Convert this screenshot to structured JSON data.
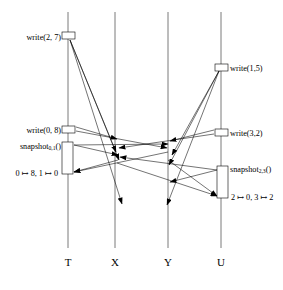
{
  "diagram": {
    "title": "",
    "type": "message-sequence-chart",
    "width": 283,
    "height": 290,
    "background": "#ffffff",
    "line_color": "#7a7a7a",
    "ink_color": "#000000",
    "processes": [
      {
        "id": "T",
        "label": "T",
        "x": 68,
        "top": 12,
        "bottom": 248,
        "axis_label_y": 266
      },
      {
        "id": "X",
        "label": "X",
        "x": 115,
        "top": 12,
        "bottom": 248,
        "axis_label_y": 266
      },
      {
        "id": "Y",
        "label": "Y",
        "x": 168,
        "top": 12,
        "bottom": 248,
        "axis_label_y": 266
      },
      {
        "id": "U",
        "label": "U",
        "x": 221,
        "top": 12,
        "bottom": 248,
        "axis_label_y": 266
      }
    ],
    "events": [
      {
        "id": "write-2-7",
        "label": "write(2, 7)",
        "process": "T",
        "label_side": "left",
        "label_x": 61,
        "label_y": 38,
        "box": {
          "x": 62,
          "y": 32,
          "w": 13,
          "h": 7
        }
      },
      {
        "id": "write-1-5",
        "label": "write(1,5)",
        "process": "U",
        "label_side": "right",
        "label_x": 230,
        "label_y": 69,
        "box": {
          "x": 215,
          "y": 64,
          "w": 13,
          "h": 7
        }
      },
      {
        "id": "write-0-8",
        "label": "write(0, 8)",
        "process": "T",
        "label_side": "left",
        "label_x": 61,
        "label_y": 131,
        "box": {
          "x": 62,
          "y": 126,
          "w": 13,
          "h": 7
        }
      },
      {
        "id": "write-3-2",
        "label": "write(3,2)",
        "process": "U",
        "label_side": "right",
        "label_x": 230,
        "label_y": 134,
        "box": {
          "x": 215,
          "y": 129,
          "w": 13,
          "h": 7
        }
      },
      {
        "id": "snapshot-0-1",
        "label_base": "snapshot",
        "label_sub": "0,1",
        "label_tail": "()",
        "label": "snapshot0,1()",
        "process": "T",
        "label_side": "left",
        "label_x": 61,
        "label_y": 147,
        "box": {
          "x": 62,
          "y": 142,
          "w": 11,
          "h": 32
        },
        "result": "0 ↦ 8, 1 ↦ 0",
        "result_x": 58,
        "result_y": 174
      },
      {
        "id": "snapshot-2-3",
        "label_base": "snapshot",
        "label_sub": "2,3",
        "label_tail": "()",
        "label": "snapshot2,3()",
        "process": "U",
        "label_side": "right",
        "label_x": 230,
        "label_y": 170,
        "box": {
          "x": 217,
          "y": 166,
          "w": 11,
          "h": 32
        },
        "result": "2 ↦ 0, 3 ↦ 2",
        "result_x": 231,
        "result_y": 198
      }
    ],
    "messages": [
      {
        "id": "m-t-write27-to-x-a",
        "from": "T",
        "to": "X",
        "x1": 70,
        "y1": 40,
        "x2": 116,
        "y2": 152,
        "arrow": true
      },
      {
        "id": "m-t-write27-to-x-b",
        "from": "T",
        "to": "X",
        "x1": 70,
        "y1": 40,
        "x2": 119,
        "y2": 160,
        "arrow": true
      },
      {
        "id": "m-t-write27-to-x-c",
        "from": "T",
        "to": "X",
        "x1": 70,
        "y1": 40,
        "x2": 122,
        "y2": 204,
        "arrow": true
      },
      {
        "id": "m-u-write15-to-y-a",
        "from": "U",
        "to": "Y",
        "x1": 219,
        "y1": 71,
        "x2": 172,
        "y2": 155,
        "arrow": true
      },
      {
        "id": "m-u-write15-to-y-b",
        "from": "U",
        "to": "Y",
        "x1": 219,
        "y1": 71,
        "x2": 169,
        "y2": 165,
        "arrow": true
      },
      {
        "id": "m-u-write15-to-y-c",
        "from": "U",
        "to": "Y",
        "x1": 219,
        "y1": 71,
        "x2": 167,
        "y2": 205,
        "arrow": true
      },
      {
        "id": "m-t-write08-to-x",
        "from": "T",
        "to": "X",
        "x1": 76,
        "y1": 127,
        "x2": 117,
        "y2": 139,
        "arrow": true
      },
      {
        "id": "m-t-write08-to-y",
        "from": "T",
        "to": "Y",
        "x1": 76,
        "y1": 131,
        "x2": 167,
        "y2": 148,
        "arrow": true
      },
      {
        "id": "m-u-write32-to-y",
        "from": "U",
        "to": "Y",
        "x1": 214,
        "y1": 130,
        "x2": 170,
        "y2": 141,
        "arrow": true
      },
      {
        "id": "m-u-write32-to-x",
        "from": "U",
        "to": "X",
        "x1": 214,
        "y1": 134,
        "x2": 119,
        "y2": 148,
        "arrow": true
      },
      {
        "id": "m-snap01-req-x",
        "from": "T",
        "to": "X",
        "x1": 74,
        "y1": 145,
        "x2": 118,
        "y2": 155,
        "arrow": true
      },
      {
        "id": "m-snap01-req-y",
        "from": "T",
        "to": "Y",
        "x1": 74,
        "y1": 145,
        "x2": 168,
        "y2": 144,
        "arrow": true
      },
      {
        "id": "m-snap01-rsp-x",
        "from": "X",
        "to": "T",
        "x1": 118,
        "y1": 160,
        "x2": 74,
        "y2": 172,
        "arrow": true
      },
      {
        "id": "m-snap01-rsp-y",
        "from": "Y",
        "to": "T",
        "x1": 168,
        "y1": 152,
        "x2": 74,
        "y2": 172,
        "arrow": true
      },
      {
        "id": "m-snap23-req-y",
        "from": "U",
        "to": "Y",
        "x1": 217,
        "y1": 170,
        "x2": 170,
        "y2": 182,
        "arrow": true
      },
      {
        "id": "m-snap23-req-x",
        "from": "U",
        "to": "X",
        "x1": 217,
        "y1": 170,
        "x2": 120,
        "y2": 157,
        "arrow": true
      },
      {
        "id": "m-snap23-rsp-y",
        "from": "Y",
        "to": "U",
        "x1": 168,
        "y1": 160,
        "x2": 217,
        "y2": 196,
        "arrow": true
      },
      {
        "id": "m-snap23-rsp-x",
        "from": "X",
        "to": "U",
        "x1": 117,
        "y1": 163,
        "x2": 217,
        "y2": 196,
        "arrow": true
      }
    ]
  }
}
